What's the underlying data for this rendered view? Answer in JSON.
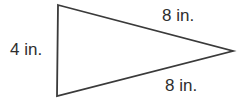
{
  "diagram": {
    "shape": "isosceles-triangle-pointing-right",
    "line_color": "#3a3a3a",
    "labels": {
      "left_side": "4 in.",
      "top_side": "8 in.",
      "bottom_side": "8 in."
    }
  }
}
